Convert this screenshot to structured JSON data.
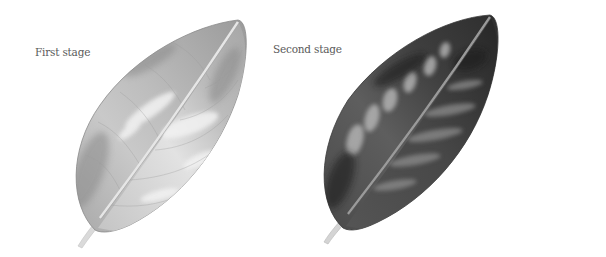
{
  "figure": {
    "panels": [
      {
        "label": "First stage",
        "shade": "light",
        "colors": {
          "base": "#b8b8b8",
          "dark": "#7a7a7a",
          "highlight": "#eeeeee",
          "stem": "#d8d8d8"
        }
      },
      {
        "label": "Second stage",
        "shade": "dark",
        "colors": {
          "base": "#555555",
          "dark": "#2a2a2a",
          "highlight": "#b0b0b0",
          "stem": "#cfcfcf"
        }
      }
    ]
  }
}
